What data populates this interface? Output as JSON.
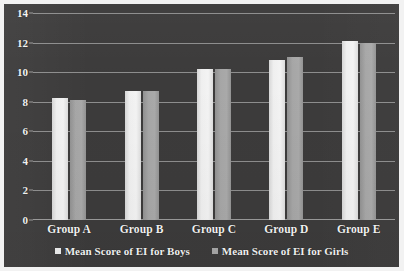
{
  "chart_data": {
    "type": "bar",
    "title": "",
    "subtitle": "",
    "xlabel": "",
    "ylabel": "",
    "categories": [
      "Group A",
      "Group B",
      "Group C",
      "Group D",
      "Group E"
    ],
    "series": [
      {
        "name": "Mean Score of EI for Boys",
        "color": "#ededed",
        "values": [
          8.25,
          8.75,
          10.2,
          10.85,
          12.1
        ]
      },
      {
        "name": "Mean Score of EI for Girls",
        "color": "#a7a7a7",
        "values": [
          8.1,
          8.7,
          10.2,
          11.0,
          12.0
        ]
      }
    ],
    "ylim": [
      0,
      14
    ],
    "ytick_values": [
      14,
      12,
      10,
      8,
      6,
      4,
      2,
      0
    ],
    "ytick_labels": [
      "14",
      "12",
      "10",
      "8",
      "6",
      "4",
      "2",
      "0"
    ],
    "grid": true,
    "grid_axis": "y",
    "legend_position": "bottom",
    "plot_background": "#3c3b3b",
    "gridline_color": "#8d8d8d",
    "text_color": "#f4f4f4",
    "frame_color": "#f2f2f2",
    "annotations": []
  },
  "legend": {
    "items": [
      {
        "label": "Mean Score of EI for Boys",
        "marker": "square-marker"
      },
      {
        "label": "Mean Score of EI for Girls",
        "marker": "square-marker"
      }
    ]
  }
}
